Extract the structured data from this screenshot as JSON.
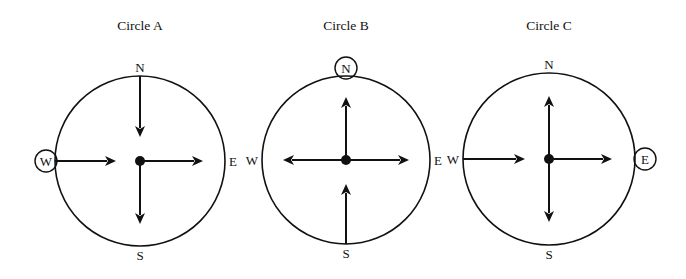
{
  "diagram": {
    "ink_color": "#111111",
    "background": "#ffffff",
    "circles": [
      {
        "id": "A",
        "title": "Circle A",
        "highlighted_direction": "W",
        "labels": {
          "N": "N",
          "S": "S",
          "E": "E",
          "W": "W"
        },
        "arrows": [
          {
            "from": "N",
            "to": "center",
            "description": "arrow from north edge pointing toward center"
          },
          {
            "from": "W",
            "to": "center",
            "description": "arrow from west edge pointing toward center"
          },
          {
            "from": "center",
            "to": "E",
            "description": "arrow from center pointing east"
          },
          {
            "from": "center",
            "to": "S",
            "description": "arrow from center pointing south"
          }
        ]
      },
      {
        "id": "B",
        "title": "Circle B",
        "highlighted_direction": "N",
        "labels": {
          "N": "N",
          "S": "S",
          "E": "E",
          "W": "W"
        },
        "arrows": [
          {
            "from": "center",
            "to": "N",
            "description": "arrow from center pointing north"
          },
          {
            "from": "center",
            "to": "W",
            "description": "arrow from center pointing west"
          },
          {
            "from": "center",
            "to": "E",
            "description": "arrow from center pointing east"
          },
          {
            "from": "S",
            "to": "center",
            "description": "arrow from south edge pointing toward center"
          }
        ]
      },
      {
        "id": "C",
        "title": "Circle C",
        "highlighted_direction": "E",
        "labels": {
          "N": "N",
          "S": "S",
          "E": "E",
          "W": "W"
        },
        "arrows": [
          {
            "from": "center",
            "to": "N",
            "description": "arrow from center pointing north"
          },
          {
            "from": "W",
            "to": "center",
            "description": "arrow from west edge pointing toward center"
          },
          {
            "from": "center",
            "to": "E",
            "description": "arrow from center pointing east"
          },
          {
            "from": "center",
            "to": "S",
            "description": "arrow from center pointing south"
          }
        ]
      }
    ]
  }
}
